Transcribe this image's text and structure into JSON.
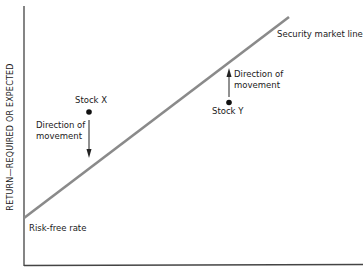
{
  "diagram": {
    "title": "Security market line",
    "y_axis_label": "RETURN—REQUIRED OR EXPECTED",
    "x_axis_label": "",
    "line_label": "Security market line",
    "intercept_label": "Risk-free rate",
    "stocks": [
      {
        "name": "Stock X",
        "position": "above line",
        "arrow_label_line1": "Direction of",
        "arrow_label_line2": "movement",
        "arrow_direction": "down"
      },
      {
        "name": "Stock Y",
        "position": "below line",
        "arrow_label_line1": "Direction of",
        "arrow_label_line2": "movement",
        "arrow_direction": "up"
      }
    ],
    "colors": {
      "axis": "#333333",
      "sml_line": "#8a8a8a",
      "dot": "#111111",
      "text": "#1a1a1a"
    }
  }
}
